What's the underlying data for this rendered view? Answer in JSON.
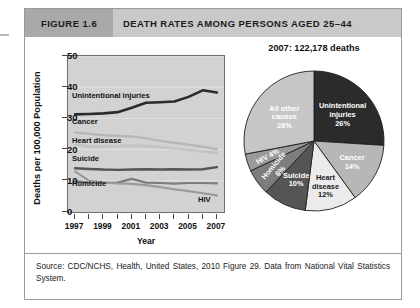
{
  "figure": {
    "number_label": "FIGURE 1.6",
    "title": "DEATH RATES AMONG PERSONS AGED 25–44",
    "source_note": "Source: CDC/NCHS, Health, United States, 2010 Figure 29. Data from National Vital Statistics System."
  },
  "colors": {
    "header_bar": "#c9c9c9",
    "header_number_bar": "#a9a9a9",
    "plot_background": "#d2d2d2",
    "unintentional_injuries": "#2b2b2b",
    "cancer": "#b7b7b7",
    "heart_disease": "#ebebeb",
    "suicide": "#555555",
    "homicide": "#7d7d7d",
    "hiv": "#9a9a9a",
    "all_other_causes": "#c6c6c6"
  },
  "chart_data": [
    {
      "type": "line",
      "title": "Death rates among persons aged 25–44",
      "xlabel": "Year",
      "ylabel": "Deaths per 100,000 Population",
      "x": [
        1997,
        1998,
        1999,
        2000,
        2001,
        2002,
        2003,
        2004,
        2005,
        2006,
        2007
      ],
      "xlim": [
        1996.5,
        2007.5
      ],
      "ylim": [
        0,
        50
      ],
      "yticks": [
        0,
        10,
        20,
        30,
        40,
        50
      ],
      "xticks": [
        1997,
        1998,
        1999,
        2000,
        2001,
        2002,
        2003,
        2004,
        2005,
        2006,
        2007
      ],
      "xtick_labels_shown": [
        "1997",
        "1999",
        "2001",
        "2003",
        "2005",
        "2007"
      ],
      "grid": false,
      "legend": "inline-labels",
      "series": [
        {
          "name": "Unintentional injuries",
          "color": "#2b2b2b",
          "values": [
            31.3,
            31.4,
            31.6,
            32.0,
            33.4,
            35.0,
            35.2,
            35.4,
            36.9,
            39.0,
            38.3
          ]
        },
        {
          "name": "Cancer",
          "color": "#b7b7b7",
          "values": [
            25.5,
            25.1,
            24.6,
            24.4,
            24.2,
            23.6,
            22.8,
            22.2,
            21.6,
            20.9,
            20.1
          ]
        },
        {
          "name": "Heart disease",
          "color": "#c3c3c3",
          "values": [
            21.6,
            21.0,
            21.0,
            21.1,
            21.3,
            21.2,
            20.8,
            20.3,
            19.9,
            19.4,
            18.9
          ]
        },
        {
          "name": "Suicide",
          "color": "#555555",
          "values": [
            14.0,
            13.8,
            13.6,
            13.5,
            13.6,
            13.7,
            13.6,
            13.7,
            13.6,
            13.7,
            14.4
          ]
        },
        {
          "name": "Homicide",
          "color": "#7d7d7d",
          "values": [
            9.9,
            9.4,
            9.3,
            9.4,
            10.6,
            9.4,
            9.3,
            9.1,
            9.3,
            9.3,
            9.2
          ]
        },
        {
          "name": "HIV",
          "color": "#9a9a9a",
          "values": [
            13.0,
            10.0,
            9.5,
            9.2,
            9.0,
            8.6,
            8.0,
            7.3,
            6.7,
            6.0,
            5.3
          ]
        }
      ]
    },
    {
      "type": "pie",
      "title": "2007:  122,178 deaths",
      "total_deaths": "122,178",
      "year": "2007",
      "categories": [
        "Unintentional injuries",
        "Cancer",
        "Heart disease",
        "Suicide",
        "Homicide",
        "HIV",
        "All other causes"
      ],
      "values": [
        26,
        14,
        12,
        10,
        6,
        4,
        28
      ],
      "slices": [
        {
          "label": "Unintentional injuries",
          "label_lines": [
            "Unintentional",
            "injuries",
            "26%"
          ],
          "percent": 26,
          "color": "#2b2b2b",
          "text_tone": "dark-bg"
        },
        {
          "label": "Cancer",
          "label_lines": [
            "Cancer",
            "14%"
          ],
          "percent": 14,
          "color": "#b7b7b7",
          "text_tone": "dark-bg"
        },
        {
          "label": "Heart disease",
          "label_lines": [
            "Heart",
            "disease",
            "12%"
          ],
          "percent": 12,
          "color": "#ebebeb",
          "text_tone": "light-bg"
        },
        {
          "label": "Suicide",
          "label_lines": [
            "Suicide",
            "10%"
          ],
          "percent": 10,
          "color": "#555555",
          "text_tone": "dark-bg"
        },
        {
          "label": "Homicide",
          "label_lines": [
            "Homicide",
            "6%"
          ],
          "percent": 6,
          "color": "#7d7d7d",
          "text_tone": "dark-bg"
        },
        {
          "label": "HIV",
          "label_lines": [
            "HIV 4%"
          ],
          "percent": 4,
          "color": "#9a9a9a",
          "text_tone": "dark-bg"
        },
        {
          "label": "All other causes",
          "label_lines": [
            "All other",
            "causes",
            "28%"
          ],
          "percent": 28,
          "color": "#c6c6c6",
          "text_tone": "dark-bg"
        }
      ]
    }
  ]
}
